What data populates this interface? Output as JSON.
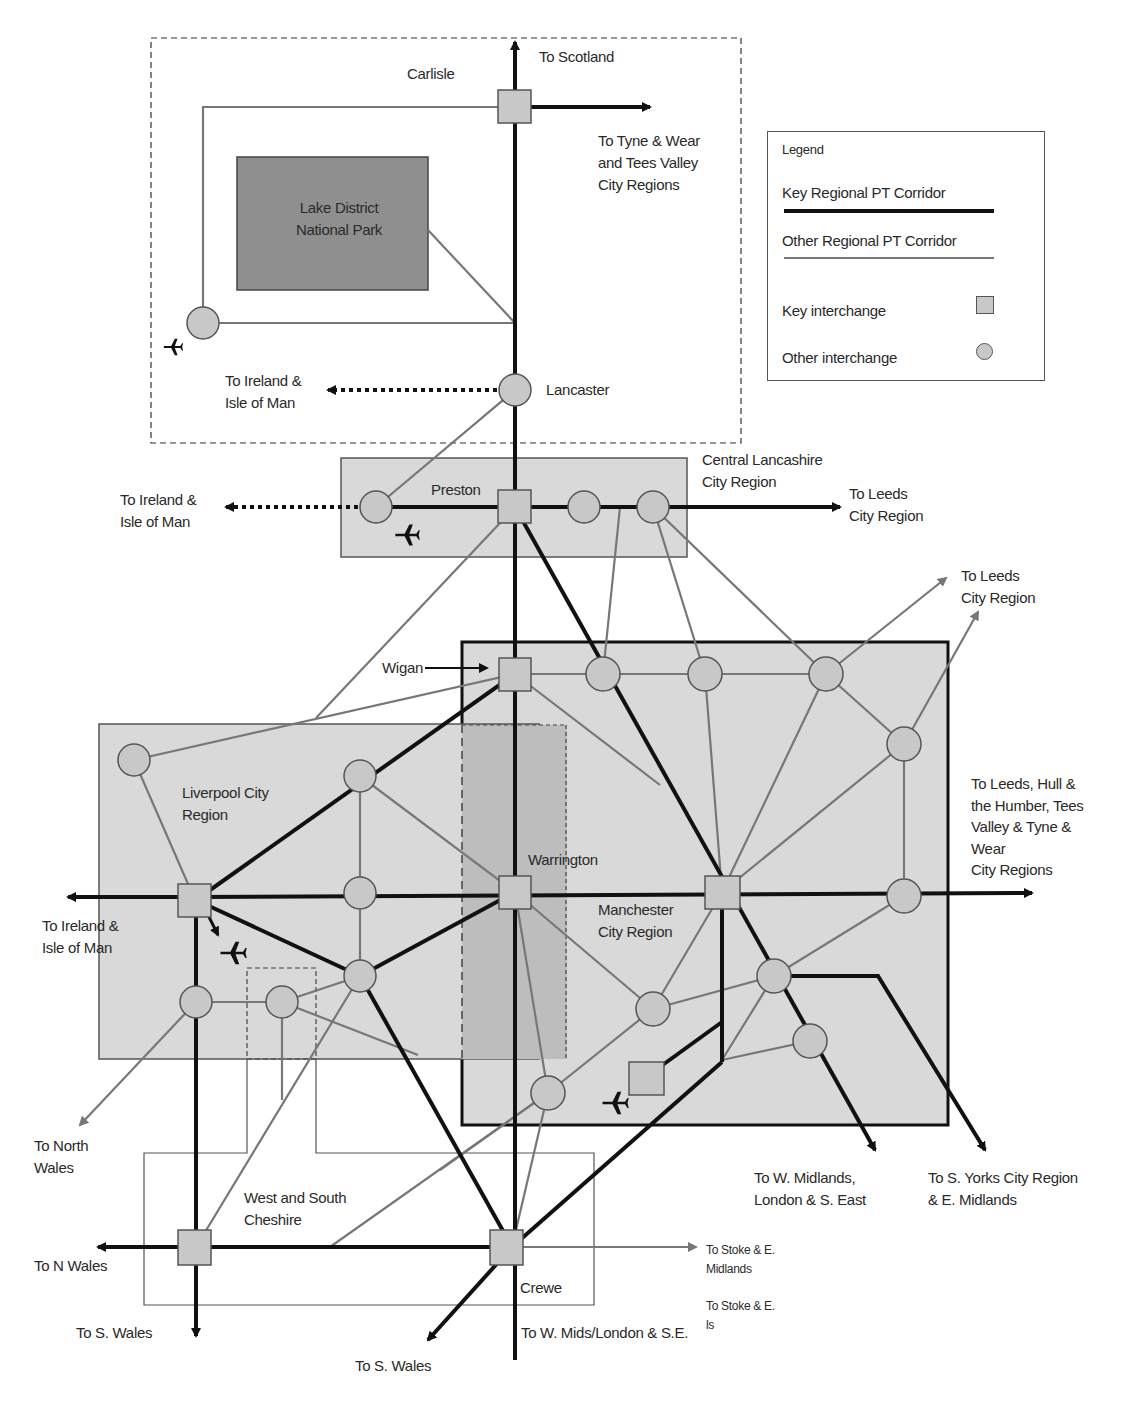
{
  "colors": {
    "key_corridor": "#111111",
    "other_corridor": "#777777",
    "region_fill": "#d9d9d9",
    "national_park_fill": "#8f8f8f",
    "warrington_band_fill": "#bdbdbd",
    "interchange_fill": "#c8c8c8",
    "interchange_stroke": "#555555"
  },
  "legend": {
    "title": "Legend",
    "items": [
      {
        "label": "Key Regional PT Corridor",
        "symbol": "thick-black-line"
      },
      {
        "label": "Other Regional PT Corridor",
        "symbol": "thin-grey-line"
      },
      {
        "label": "Key interchange",
        "symbol": "square"
      },
      {
        "label": "Other interchange",
        "symbol": "circle"
      }
    ]
  },
  "regions": {
    "lake_district": "Lake District\nNational Park",
    "central_lancashire": "Central Lancashire\nCity Region",
    "liverpool": "Liverpool City\nRegion",
    "manchester": "Manchester\nCity Region",
    "west_south_cheshire": "West and South\nCheshire"
  },
  "places": {
    "carlisle": "Carlisle",
    "lancaster": "Lancaster",
    "preston": "Preston",
    "wigan": "Wigan",
    "warrington": "Warrington",
    "crewe": "Crewe"
  },
  "destinations": {
    "scotland": "To Scotland",
    "tyne_tees": "To Tyne & Wear\nand Tees Valley\nCity Regions",
    "ireland_lancaster": "To Ireland &\nIsle of Man",
    "ireland_preston": "To Ireland &\nIsle of Man",
    "leeds_preston": "To Leeds\nCity Region",
    "leeds_manchester": "To Leeds\nCity Region",
    "leeds_hull": "To Leeds, Hull &\nthe Humber, Tees\nValley &  Tyne &\nWear\nCity Regions",
    "ireland_liverpool": "To Ireland &\nIsle of Man",
    "north_wales": "To North\nWales",
    "n_wales": "To N Wales",
    "s_wales_1": "To S. Wales",
    "s_wales_2": "To S. Wales",
    "w_mids_london": "To W. Mids/London & S.E.",
    "stoke_1": "To Stoke & E.\nMidlands",
    "stoke_2": "To Stoke & E.\n    ls",
    "w_midlands_se": "To W. Midlands,\nLondon & S. East",
    "s_yorks": "To S. Yorks City Region\n& E. Midlands"
  },
  "icons": {
    "airport": "airplane-icon"
  }
}
